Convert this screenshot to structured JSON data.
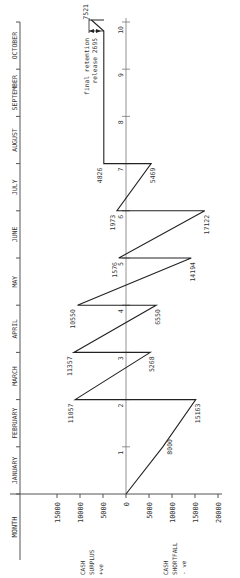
{
  "chart_data": {
    "type": "line",
    "orientation": "rotated-90 (time runs bottom to top, amount runs left to right)",
    "title": "",
    "xlabel": "MONTH",
    "ylabel_positive": [
      "CASH",
      "SURPLUS",
      "+ve"
    ],
    "ylabel_negative": [
      "CASH",
      "SHORTFALL",
      "- ve"
    ],
    "months": [
      "JANUARY",
      "FEBRUARY",
      "MARCH",
      "APRIL",
      "MAY",
      "JUNE",
      "JULY",
      "AUGUST",
      "SEPTEMBER",
      "OCTOBER"
    ],
    "amount_ticks": {
      "surplus": [
        "15000",
        "10000",
        "5000"
      ],
      "zero": "0",
      "shortfall": [
        "5000",
        "10000",
        "15000",
        "20000"
      ]
    },
    "period_markers": [
      "1",
      "2",
      "3",
      "4",
      "5",
      "6",
      "7",
      "8",
      "9",
      "10"
    ],
    "series": [
      {
        "name": "Cash flow (surplus positive, shortfall negative)",
        "points": [
          {
            "period": 0,
            "value": 0,
            "label": ""
          },
          {
            "period": 1,
            "value": -8000,
            "label": "8000"
          },
          {
            "period": 2,
            "value": -15163,
            "label": "15163"
          },
          {
            "period": 2,
            "value": 11057,
            "label": "11057"
          },
          {
            "period": 3,
            "value": -5268,
            "label": "5268"
          },
          {
            "period": 3,
            "value": 11357,
            "label": "11357"
          },
          {
            "period": 4,
            "value": -6550,
            "label": "6550"
          },
          {
            "period": 4,
            "value": 10550,
            "label": "10550"
          },
          {
            "period": 5,
            "value": -14194,
            "label": "14194"
          },
          {
            "period": 5,
            "value": 1576,
            "label": "1576"
          },
          {
            "period": 6,
            "value": -17122,
            "label": "17122"
          },
          {
            "period": 6,
            "value": 1973,
            "label": "1973"
          },
          {
            "period": 7,
            "value": -5469,
            "label": "5469"
          },
          {
            "period": 7,
            "value": 4826,
            "label": "4826"
          },
          {
            "period": 10,
            "value": 4826,
            "label": ""
          },
          {
            "period": 10,
            "value": 7521,
            "label": "7521"
          }
        ]
      }
    ],
    "annotations": [
      {
        "text": "final retention",
        "at_period": 10
      },
      {
        "text": "release 2695",
        "at_period": 10
      },
      {
        "text": "7521",
        "at_period": 10
      }
    ],
    "amount_range": [
      -20000,
      15000
    ],
    "grid": false
  },
  "labels": {
    "month_axis_title": "MONTH",
    "surplus": [
      "CASH",
      "SURPLUS",
      "+ve"
    ],
    "shortfall": [
      "CASH",
      "SHORTFALL",
      "- ve"
    ],
    "retention_line1": "final retention",
    "retention_line2": "release 2695",
    "retention_total": "7521"
  }
}
